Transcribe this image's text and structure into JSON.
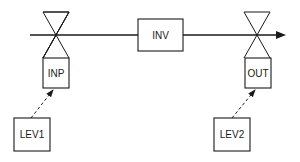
{
  "diagram": {
    "type": "process-flow",
    "main_line": {
      "direction": "left-to-right",
      "arrow": "right"
    },
    "nodes": {
      "inp": {
        "label": "INP",
        "kind": "valve-actuator",
        "position": "left"
      },
      "inv": {
        "label": "INV",
        "kind": "process-block",
        "position": "center"
      },
      "out": {
        "label": "OUT",
        "kind": "valve-actuator",
        "position": "right"
      },
      "lev1": {
        "label": "LEV1",
        "kind": "controller",
        "position": "bottom-left"
      },
      "lev2": {
        "label": "LEV2",
        "kind": "controller",
        "position": "bottom-right"
      }
    },
    "edges": [
      {
        "from": "lev1",
        "to": "inp",
        "style": "dashed-arrow"
      },
      {
        "from": "lev2",
        "to": "out",
        "style": "dashed-arrow"
      }
    ],
    "colors": {
      "ink": "#1a1a1a",
      "background": "#ffffff"
    }
  }
}
